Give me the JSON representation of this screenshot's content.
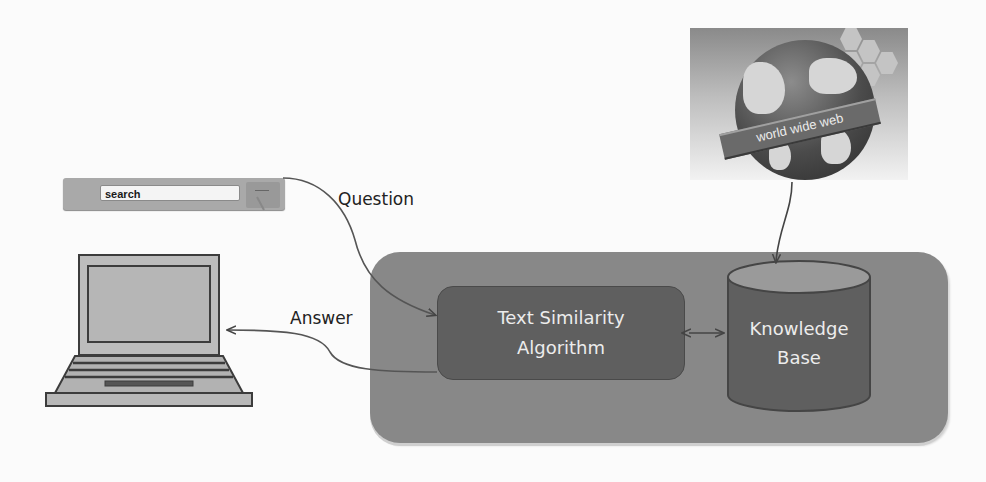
{
  "diagram": {
    "type": "question-answering system overview",
    "search_bar": {
      "input_value": "search",
      "icon": "search-bar-icon"
    },
    "globe": {
      "icon": "globe-icon",
      "banner_text": "world wide web"
    },
    "laptop": {
      "icon": "laptop-icon"
    },
    "labels": {
      "question": "Question",
      "answer": "Answer"
    },
    "system": {
      "algorithm_line1": "Text Similarity",
      "algorithm_line2": "Algorithm",
      "knowledge_line1": "Knowledge",
      "knowledge_line2": "Base"
    },
    "edges": [
      {
        "from": "search_bar",
        "to": "algorithm",
        "label": "Question"
      },
      {
        "from": "algorithm",
        "to": "laptop",
        "label": "Answer"
      },
      {
        "from": "globe",
        "to": "knowledge_base",
        "label": ""
      },
      {
        "from": "algorithm",
        "to": "knowledge_base",
        "label": "",
        "bidirectional": true
      }
    ],
    "colors": {
      "background": "#fbfbfb",
      "container": "#888888",
      "algorithm_box": "#5f5f5f",
      "knowledge_base": "#5f5f5f",
      "knowledge_top": "#9a9a9a",
      "text_light": "#ececec",
      "text_dark": "#222222"
    }
  }
}
